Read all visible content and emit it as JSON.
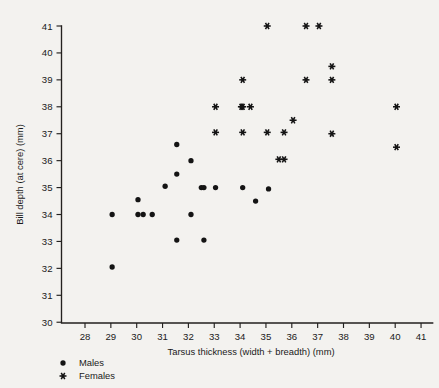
{
  "chart_data": {
    "type": "scatter",
    "title": "",
    "xlabel": "Tarsus thickness (width + breadth) (mm)",
    "ylabel": "Bill depth (at cere) (mm)",
    "xlim": [
      27.5,
      41.5
    ],
    "ylim": [
      29.4,
      41.4
    ],
    "xticks": [
      28,
      29,
      30,
      31,
      32,
      33,
      34,
      35,
      36,
      37,
      38,
      39,
      40,
      41
    ],
    "yticks": [
      30,
      31,
      32,
      33,
      34,
      35,
      36,
      37,
      38,
      39,
      40,
      41
    ],
    "xtick_labels": [
      "28",
      "29",
      "30",
      "31",
      "32",
      "33",
      "34",
      "35",
      "36",
      "37",
      "38",
      "39",
      "40",
      "41"
    ],
    "ytick_labels": [
      "30",
      "31",
      "32",
      "33",
      "34",
      "35",
      "36",
      "37",
      "38",
      "39",
      "40",
      "41"
    ],
    "grid": false,
    "legend_position": "below-left",
    "series": [
      {
        "name": "Males",
        "marker": "circle",
        "color": "#141414",
        "points": [
          [
            29.05,
            32.05
          ],
          [
            29.05,
            34.0
          ],
          [
            30.05,
            34.55
          ],
          [
            30.05,
            34.0
          ],
          [
            30.25,
            34.0
          ],
          [
            30.6,
            34.0
          ],
          [
            31.1,
            35.05
          ],
          [
            31.55,
            36.6
          ],
          [
            31.55,
            35.5
          ],
          [
            31.55,
            33.05
          ],
          [
            32.1,
            36.0
          ],
          [
            32.1,
            34.0
          ],
          [
            32.5,
            35.0
          ],
          [
            32.6,
            35.0
          ],
          [
            32.6,
            33.05
          ],
          [
            33.05,
            35.0
          ],
          [
            34.1,
            35.0
          ],
          [
            34.6,
            34.5
          ],
          [
            35.1,
            34.95
          ]
        ]
      },
      {
        "name": "Females",
        "marker": "asterisk",
        "color": "#141414",
        "points": [
          [
            33.05,
            38.0
          ],
          [
            33.05,
            37.05
          ],
          [
            34.05,
            38.0
          ],
          [
            34.1,
            39.0
          ],
          [
            34.1,
            38.0
          ],
          [
            34.1,
            37.05
          ],
          [
            34.4,
            38.0
          ],
          [
            35.05,
            41.0
          ],
          [
            35.05,
            37.05
          ],
          [
            35.5,
            36.05
          ],
          [
            35.7,
            36.05
          ],
          [
            35.7,
            37.05
          ],
          [
            36.05,
            37.5
          ],
          [
            36.55,
            41.0
          ],
          [
            36.55,
            39.0
          ],
          [
            37.05,
            41.0
          ],
          [
            37.55,
            39.5
          ],
          [
            37.55,
            39.0
          ],
          [
            37.55,
            37.0
          ],
          [
            40.05,
            38.0
          ],
          [
            40.05,
            36.5
          ]
        ]
      }
    ]
  },
  "legend": {
    "items": [
      {
        "label": "Males",
        "marker": "circle"
      },
      {
        "label": "Females",
        "marker": "asterisk"
      }
    ]
  },
  "colors": {
    "background": "#f3f2ef",
    "ink": "#1a1a1a",
    "marker": "#141414"
  }
}
